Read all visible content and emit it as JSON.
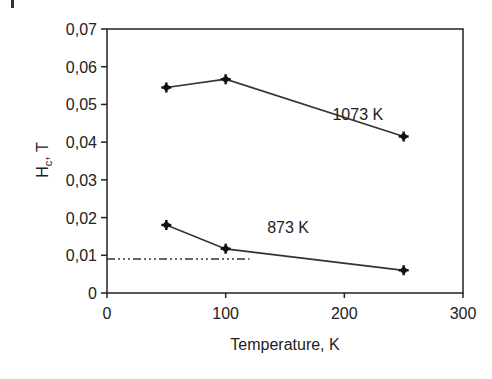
{
  "chart_data": {
    "type": "line",
    "title": "",
    "xlabel": "Temperature, K",
    "ylabel": "H_c, T",
    "ylabel_main": "H",
    "ylabel_sub": "c",
    "ylabel_tail": ", T",
    "xlim": [
      0,
      300
    ],
    "ylim": [
      0,
      0.07
    ],
    "xticks": [
      "0",
      "100",
      "200",
      "300"
    ],
    "yticks": [
      "0",
      "0,01",
      "0,02",
      "0,03",
      "0,04",
      "0,05",
      "0,06",
      "0,07"
    ],
    "grid": false,
    "legend": "none (inline annotations)",
    "series": [
      {
        "name": "1073 K",
        "x": [
          50,
          100,
          250
        ],
        "y": [
          0.0545,
          0.0567,
          0.0415
        ]
      },
      {
        "name": "873 K",
        "x": [
          50,
          100,
          250
        ],
        "y": [
          0.018,
          0.0117,
          0.006
        ]
      }
    ],
    "reference_line": {
      "style": "dash-dot",
      "y": 0.009,
      "x": [
        0,
        120
      ]
    },
    "annotations": [
      {
        "text": "1073 K",
        "x": 190,
        "y": 0.046
      },
      {
        "text": "873 K",
        "x": 135,
        "y": 0.016
      }
    ]
  }
}
